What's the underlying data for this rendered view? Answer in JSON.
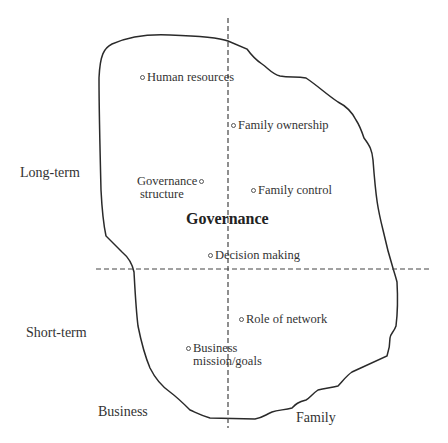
{
  "diagram": {
    "center_label": "Governance",
    "axes": {
      "vertical_top": "Long-term",
      "vertical_bottom": "Short-term",
      "horizontal_left": "Business",
      "horizontal_right": "Family"
    },
    "items": [
      {
        "label": "Human resources",
        "dot_side": "left"
      },
      {
        "label": "Family ownership",
        "dot_side": "left"
      },
      {
        "label": "Governance",
        "label2": "structure",
        "dot_side": "right"
      },
      {
        "label": "Family control",
        "dot_side": "left"
      },
      {
        "label": "Decision making",
        "dot_side": "left"
      },
      {
        "label": "Role of network",
        "dot_side": "left"
      },
      {
        "label": "Business",
        "label2": "mission/goals",
        "dot_side": "left"
      }
    ]
  }
}
